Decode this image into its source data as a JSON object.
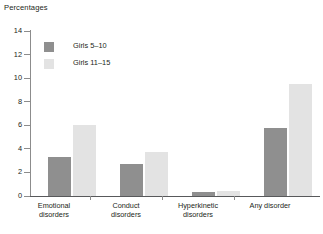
{
  "chart_data": {
    "type": "bar",
    "title": "Percentages",
    "xlabel": "",
    "ylabel": "Percentages",
    "ylim": [
      0,
      14
    ],
    "yticks": [
      0,
      2,
      4,
      6,
      8,
      10,
      12,
      14
    ],
    "ytick_labels": [
      "0",
      "2",
      "4",
      "6",
      "8",
      "10",
      "12",
      "14"
    ],
    "grid": false,
    "legend_position": "top-left",
    "categories": [
      "Emotional disorders",
      "Conduct disorders",
      "Hyperkinetic disorders",
      "Any disorder"
    ],
    "category_lines": [
      [
        "Emotional",
        "disorders"
      ],
      [
        "Conduct",
        "disorders"
      ],
      [
        "Hyperkinetic",
        "disorders"
      ],
      [
        "Any disorder",
        ""
      ]
    ],
    "series": [
      {
        "name": "Girls 5–10",
        "color": "#8f8f8f",
        "values": [
          3.3,
          2.7,
          0.3,
          5.8
        ]
      },
      {
        "name": "Girls 11–15",
        "color": "#e3e3e3",
        "values": [
          6.0,
          3.7,
          0.4,
          9.5
        ]
      }
    ]
  },
  "legend": {
    "entries": [
      {
        "label": "Girls 5–10"
      },
      {
        "label": "Girls 11–15"
      }
    ]
  }
}
